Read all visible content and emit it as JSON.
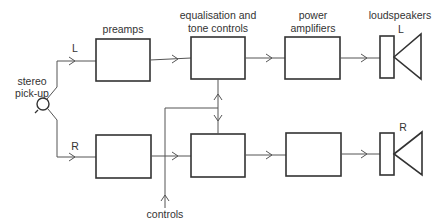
{
  "colors": {
    "line": "#555555",
    "box": "#333333",
    "text": "#333333",
    "background": "#ffffff"
  },
  "labels": {
    "preamps": "preamps",
    "eq_line1": "equalisation and",
    "eq_line2": "tone controls",
    "power_line1": "power",
    "power_line2": "amplifiers",
    "loudspeakers": "loudspeakers",
    "pickup_line1": "stereo",
    "pickup_line2": "pick-up",
    "channel_left": "L",
    "channel_right": "R",
    "speaker_left": "L",
    "speaker_right": "R",
    "controls": "controls"
  },
  "blocks": [
    {
      "id": "preamp-left",
      "channel": "L",
      "stage": "preamps"
    },
    {
      "id": "eq-left",
      "channel": "L",
      "stage": "equalisation and tone controls"
    },
    {
      "id": "power-left",
      "channel": "L",
      "stage": "power amplifiers"
    },
    {
      "id": "speaker-left",
      "channel": "L",
      "stage": "loudspeakers"
    },
    {
      "id": "preamp-right",
      "channel": "R",
      "stage": "preamps"
    },
    {
      "id": "eq-right",
      "channel": "R",
      "stage": "equalisation and tone controls"
    },
    {
      "id": "power-right",
      "channel": "R",
      "stage": "power amplifiers"
    },
    {
      "id": "speaker-right",
      "channel": "R",
      "stage": "loudspeakers"
    }
  ]
}
